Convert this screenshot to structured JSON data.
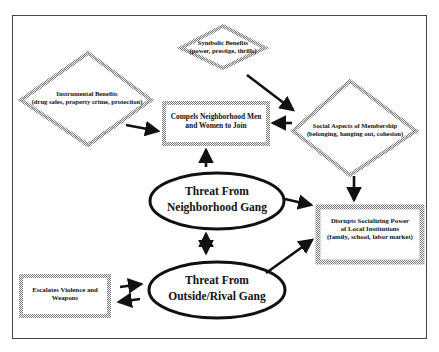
{
  "diagram": {
    "nodes": {
      "symbolic": {
        "title": "Symbolic Benefits",
        "detail": "(power, prestige, thrills)",
        "shape": "diamond"
      },
      "instrumental": {
        "title": "Instrumental Benefits",
        "detail": "(drug sales, property crime, protection)",
        "shape": "diamond"
      },
      "social": {
        "title": "Social Aspects of Membership",
        "detail": "(belonging, hanging out, cohesion)",
        "shape": "diamond"
      },
      "compels": {
        "line1": "Compels Neighborhood Men",
        "line2": "and Women to Join",
        "shape": "box"
      },
      "disrupts": {
        "line1": "Disrupts Socializing Power",
        "line2": "of Local Institutions",
        "line3": "(family, school, labor market)",
        "shape": "box"
      },
      "escalates": {
        "line1": "Escalates Violence and",
        "line2": "Weapons",
        "shape": "box"
      },
      "neighborhood": {
        "line1": "Threat From",
        "line2": "Neighborhood Gang",
        "shape": "ellipse"
      },
      "rival": {
        "line1": "Threat From",
        "line2": "Outside/Rival Gang",
        "shape": "ellipse"
      }
    },
    "edges": [
      {
        "from": "instrumental",
        "to": "compels"
      },
      {
        "from": "symbolic",
        "to": "social"
      },
      {
        "from": "social",
        "to": "compels"
      },
      {
        "from": "social",
        "to": "disrupts"
      },
      {
        "from": "neighborhood",
        "to": "compels"
      },
      {
        "from": "neighborhood",
        "to": "disrupts"
      },
      {
        "from": "neighborhood",
        "to": "rival",
        "bidirectional": true
      },
      {
        "from": "rival",
        "to": "disrupts"
      },
      {
        "from": "escalates",
        "to": "rival"
      },
      {
        "from": "rival",
        "to": "escalates"
      }
    ]
  }
}
